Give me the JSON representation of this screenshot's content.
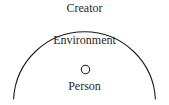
{
  "diagram": {
    "background_color": "#ffffff",
    "stroke_color": "#1a1a1a",
    "labels": {
      "outer": "Creator",
      "middle": "Environment",
      "inner": "Person"
    },
    "shapes": {
      "environment_arc": {
        "type": "arc",
        "description": "large semicircular dome boundary",
        "center_x": 84.5,
        "center_y": 98,
        "radius": 71,
        "stroke_width": 1
      },
      "person_circle": {
        "type": "circle",
        "center_x": 85.5,
        "center_y": 69.5,
        "radius": 4.2,
        "stroke_width": 1,
        "fill": "none"
      }
    }
  }
}
